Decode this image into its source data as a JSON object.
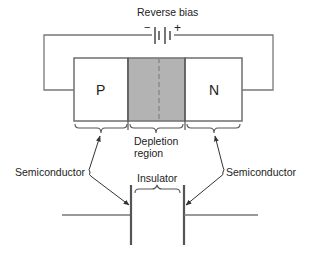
{
  "diagram": {
    "title": "Reverse bias",
    "battery": {
      "minus": "−",
      "plus": "+"
    },
    "junction": {
      "p_label": "P",
      "n_label": "N",
      "depletion_label_line1": "Depletion",
      "depletion_label_line2": "region"
    },
    "capacitor": {
      "insulator_label": "Insulator"
    },
    "annotations": {
      "left": "Semiconductor",
      "right": "Semiconductor"
    },
    "colors": {
      "line": "#555555",
      "depletion_fill": "#b3b3b3",
      "text": "#222222"
    }
  }
}
